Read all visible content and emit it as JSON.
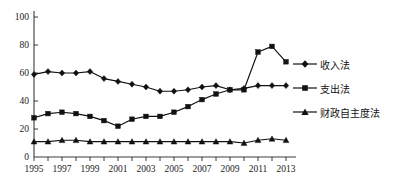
{
  "chart_data": {
    "type": "line",
    "title": "",
    "subtitle": "",
    "xlabel": "",
    "ylabel": "",
    "xlim": [
      1995,
      2013
    ],
    "ylim": [
      0,
      100
    ],
    "yticks": [
      0,
      20,
      40,
      60,
      80,
      100
    ],
    "xticks": [
      1995,
      1997,
      1999,
      2001,
      2003,
      2005,
      2007,
      2009,
      2011,
      2013
    ],
    "xtick_labels": [
      "1995",
      "1997",
      "1999",
      "2001",
      "2003",
      "2005",
      "2007",
      "2009",
      "2011",
      "2013"
    ],
    "ytick_labels": [
      "0",
      "20",
      "40",
      "60",
      "80",
      "100"
    ],
    "grid": false,
    "legend_position": "right",
    "x": [
      1995,
      1996,
      1997,
      1998,
      1999,
      2000,
      2001,
      2002,
      2003,
      2004,
      2005,
      2006,
      2007,
      2008,
      2009,
      2010,
      2011,
      2012,
      2013
    ],
    "series": [
      {
        "name": "收入法",
        "marker": "diamond",
        "color": "#111111",
        "values": [
          59,
          61,
          60,
          60,
          61,
          56,
          54,
          52,
          50,
          47,
          47,
          48,
          50,
          51,
          48,
          49,
          51,
          51,
          51
        ]
      },
      {
        "name": "支出法",
        "marker": "square",
        "color": "#111111",
        "values": [
          28,
          31,
          32,
          31,
          29,
          26,
          22,
          27,
          29,
          29,
          32,
          36,
          41,
          45,
          48,
          48,
          75,
          79,
          68
        ]
      },
      {
        "name": "财政自主度法",
        "marker": "triangle",
        "color": "#111111",
        "values": [
          11,
          11,
          12,
          12,
          11,
          11,
          11,
          11,
          11,
          11,
          11,
          11,
          11,
          11,
          11,
          10,
          12,
          13,
          12
        ]
      }
    ]
  },
  "legend": {
    "items": [
      {
        "label": "收入法",
        "marker": "diamond-marker"
      },
      {
        "label": "支出法",
        "marker": "square-marker"
      },
      {
        "label": "财政自主度法",
        "marker": "triangle-marker"
      }
    ]
  },
  "colors": {
    "axis": "#3a3a3a",
    "series": "#111111",
    "background": "#ffffff"
  }
}
